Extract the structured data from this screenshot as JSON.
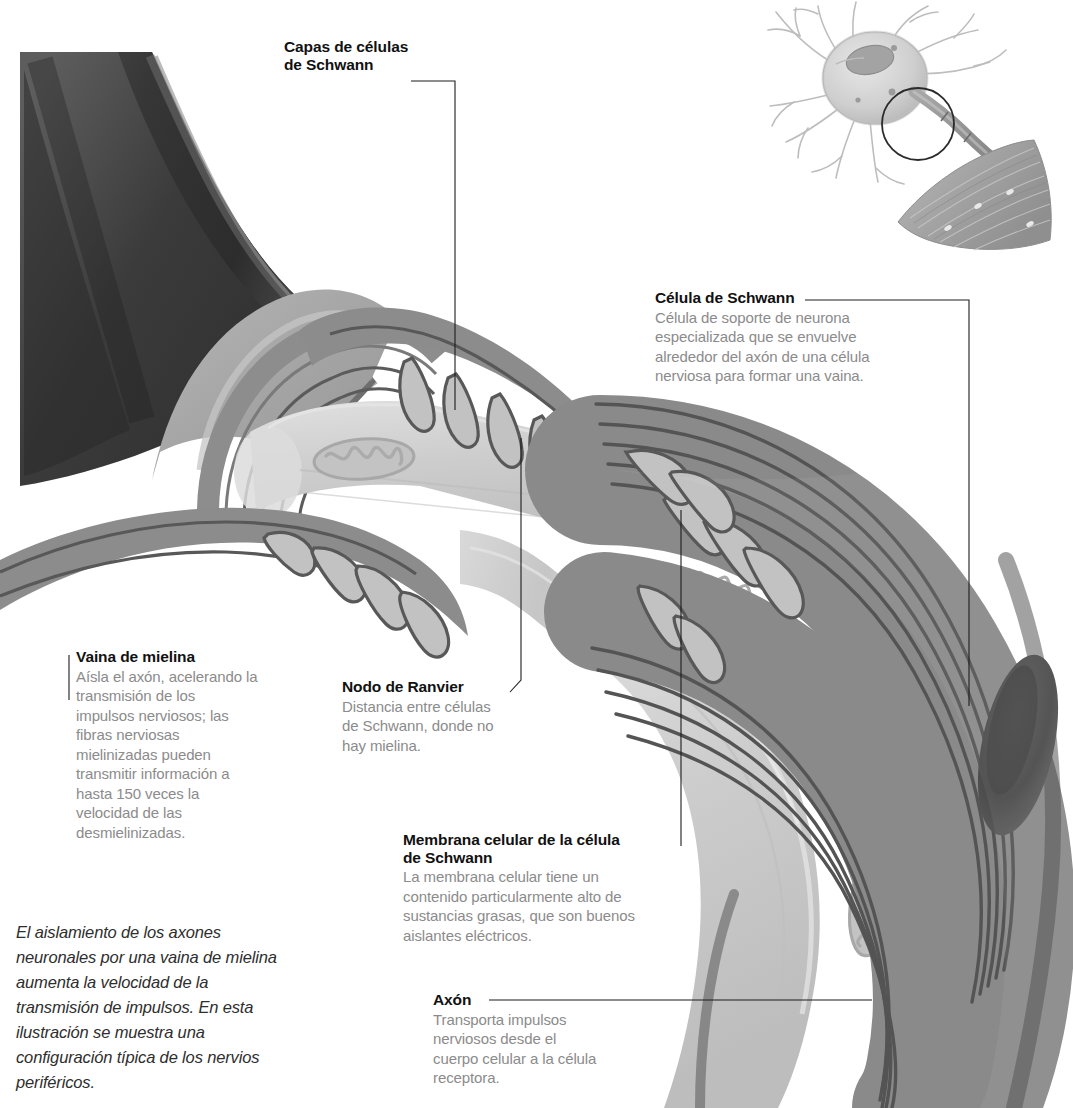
{
  "figure": {
    "language": "es",
    "style": "grayscale medical illustration"
  },
  "palette": {
    "background": "#ffffff",
    "outer_sheath_dark": "#3a3a3a",
    "myelin_mid": "#8a8a8a",
    "myelin_line": "#555555",
    "axon_pale": "#cfcfcf",
    "axon_light": "#dedede",
    "nucleus_dark": "#4a4a4a",
    "title_text": "#111111",
    "body_text": "#8b8b8b",
    "caption_text": "#2e2e2e",
    "leader_line": "#1d1d1d"
  },
  "callouts": [
    {
      "id": "capas-de-celulas-de-schwann",
      "title": "Capas de células\nde Schwann",
      "body": ""
    },
    {
      "id": "celula-de-schwann",
      "title": "Célula de Schwann",
      "body": "Célula de soporte de neurona\nespecializada que se envuelve\nalrededor del axón de una célula\nnerviosa para formar una vaina."
    },
    {
      "id": "vaina-de-mielina",
      "title": "Vaina de mielina",
      "body": "Aísla el axón, acelerando la\ntransmisión de los\nimpulsos nerviosos; las\nfibras nerviosas\nmielinizadas pueden\ntransmitir información a\nhasta 150 veces la\nvelocidad de las\ndesmielinizadas."
    },
    {
      "id": "nodo-de-ranvier",
      "title": "Nodo de Ranvier",
      "body": "Distancia entre células\nde Schwann, donde no\nhay mielina."
    },
    {
      "id": "membrana-celular-de-la-celula-de-schwann",
      "title": "Membrana celular de la célula\nde Schwann",
      "body": "La membrana celular tiene un\ncontenido particularmente alto de\nsustancias grasas, que son buenos\naislantes eléctricos."
    },
    {
      "id": "axon",
      "title": "Axón",
      "body": "Transporta impulsos\nnerviosos desde el\ncuerpo celular a la célula\nreceptora."
    }
  ],
  "caption": "El aislamiento de los axones\nneuronales por una vaina de mielina\naumenta la velocidad de la\ntransmisión de impulsos. En esta\nilustración se muestra una\nconfiguración típica de los nervios\nperiféricos.",
  "inset": {
    "id": "neuron-overview-inset",
    "parts": [
      "dendritas",
      "cuerpo celular",
      "núcleo",
      "axón mielinizado",
      "región ampliada",
      "terminal en fibra muscular"
    ]
  }
}
